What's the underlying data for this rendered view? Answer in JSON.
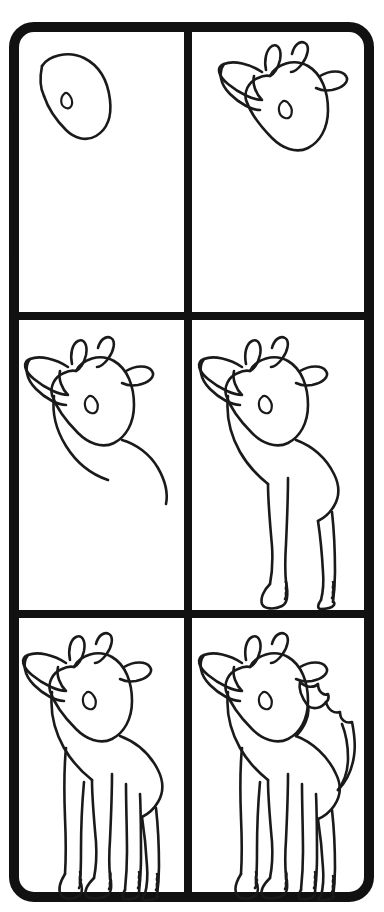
{
  "sheet": {
    "title": "How to Draw a Giraffe - Step by Step",
    "type": "step-by-step drawing tutorial",
    "subject": "giraffe",
    "background_color": "#ffffff",
    "ink_color": "#1a1a1a",
    "frame_color": "#111111",
    "frame_thickness_px": 10,
    "corner_radius_px": 22,
    "grid": {
      "columns": 2,
      "rows": 3,
      "total_panels": 6
    }
  },
  "panels": [
    {
      "index": 1,
      "position": "row-1-col-1",
      "step_label": "Step 1",
      "description": "Head outline with eye",
      "elements": [
        "head-outline",
        "eye"
      ]
    },
    {
      "index": 2,
      "position": "row-1-col-2",
      "step_label": "Step 2",
      "description": "Add ears and horns to the head",
      "elements": [
        "head-outline",
        "eye",
        "left-ear",
        "right-ear",
        "horn-left",
        "horn-right"
      ]
    },
    {
      "index": 3,
      "position": "row-2-col-1",
      "step_label": "Step 3",
      "description": "Add the neck and back line",
      "elements": [
        "head",
        "ears",
        "horns",
        "eye",
        "neck-front",
        "neck-back",
        "body-back-curve"
      ]
    },
    {
      "index": 4,
      "position": "row-2-col-2",
      "step_label": "Step 4",
      "description": "Add the front legs with hooves",
      "elements": [
        "head",
        "ears",
        "horns",
        "eye",
        "neck",
        "body",
        "front-leg-near",
        "front-leg-far",
        "hoof-near",
        "hoof-far"
      ]
    },
    {
      "index": 5,
      "position": "row-3-col-1",
      "step_label": "Step 5",
      "description": "Add the hind legs and all four hooves",
      "elements": [
        "head",
        "ears",
        "horns",
        "eye",
        "neck",
        "body",
        "front-legs",
        "hind-legs",
        "hooves"
      ]
    },
    {
      "index": 6,
      "position": "row-3-col-2",
      "step_label": "Step 6",
      "description": "Add the zigzag mane along the back",
      "elements": [
        "head",
        "ears",
        "horns",
        "eye",
        "neck",
        "body",
        "front-legs",
        "hind-legs",
        "hooves",
        "zigzag-mane"
      ]
    }
  ],
  "layout_metrics": {
    "outer_left": 9,
    "outer_top": 22,
    "outer_right": 374,
    "outer_bottom": 902,
    "vertical_divider_x": 188,
    "horizontal_divider_1_y": 316,
    "horizontal_divider_2_y": 614
  }
}
